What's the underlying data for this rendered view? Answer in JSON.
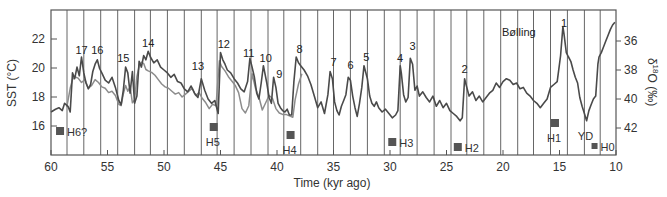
{
  "chart_data": {
    "type": "line",
    "title": "",
    "xlabel": "Time (kyr ago)",
    "ylabel": "SST (°C)",
    "ylabel_right": "δ18O (‰)",
    "ylabel_right_main": "δ",
    "ylabel_right_sup": "18",
    "ylabel_right_rest": "O (‰)",
    "xlim": [
      60,
      10
    ],
    "ylim": [
      14.0,
      23.8
    ],
    "ylim_right": [
      43.8,
      34.3
    ],
    "x_ticks": [
      60,
      55,
      50,
      45,
      40,
      35,
      30,
      25,
      20,
      15,
      10
    ],
    "y_ticks": [
      16,
      18,
      20,
      22
    ],
    "y_ticks_right": [
      36,
      38,
      40,
      42
    ],
    "grid": "vertical lines every ~1.47 kyr",
    "vertical_lines": [
      58.58,
      57.1,
      55.6,
      54.1,
      52.6,
      51.2,
      49.7,
      48.2,
      46.7,
      45.3,
      43.8,
      42.3,
      40.8,
      39.4,
      37.9,
      36.4,
      35.0,
      33.5,
      32.0,
      30.5,
      29.1,
      27.6,
      26.1,
      24.6,
      23.2,
      21.7,
      20.2,
      18.7,
      17.3,
      15.8,
      14.3,
      12.8,
      11.4
    ],
    "colors": {
      "d18O": "#4a4a4a",
      "sst": "#8c8c8c",
      "frame": "#555555",
      "grid": "#666666",
      "marker": "#555555"
    },
    "series": [
      {
        "name": "δ18O (‰)",
        "axis": "right",
        "x": [
          60.0,
          59.6,
          59.3,
          59.0,
          58.8,
          58.5,
          58.3,
          58.1,
          57.9,
          57.7,
          57.5,
          57.3,
          57.1,
          56.9,
          56.7,
          56.5,
          56.3,
          56.1,
          55.9,
          55.7,
          55.5,
          55.2,
          54.9,
          54.6,
          54.3,
          54.0,
          53.8,
          53.6,
          53.4,
          53.2,
          53.0,
          52.8,
          52.6,
          52.4,
          52.2,
          52.0,
          51.8,
          51.6,
          51.4,
          51.2,
          50.9,
          50.6,
          50.3,
          50.0,
          49.7,
          49.4,
          49.1,
          48.8,
          48.5,
          48.2,
          47.9,
          47.6,
          47.3,
          47.0,
          46.7,
          46.4,
          46.1,
          45.8,
          45.5,
          45.2,
          45.0,
          44.8,
          44.6,
          44.4,
          44.1,
          43.8,
          43.5,
          43.2,
          42.9,
          42.6,
          42.4,
          42.2,
          42.0,
          41.8,
          41.6,
          41.4,
          41.2,
          40.9,
          40.7,
          40.5,
          40.3,
          40.1,
          39.9,
          39.7,
          39.5,
          39.3,
          39.1,
          38.9,
          38.7,
          38.5,
          38.3,
          38.1,
          37.9,
          37.6,
          37.3,
          37.0,
          36.7,
          36.4,
          36.1,
          35.8,
          35.5,
          35.3,
          35.1,
          34.9,
          34.7,
          34.5,
          34.3,
          34.1,
          33.9,
          33.7,
          33.5,
          33.3,
          33.1,
          32.9,
          32.7,
          32.5,
          32.3,
          32.0,
          31.8,
          31.6,
          31.4,
          31.2,
          31.0,
          30.7,
          30.4,
          30.1,
          29.8,
          29.5,
          29.3,
          29.1,
          29.0,
          28.8,
          28.6,
          28.4,
          28.2,
          28.0,
          27.8,
          27.6,
          27.4,
          27.1,
          26.8,
          26.5,
          26.2,
          25.9,
          25.6,
          25.3,
          25.0,
          24.7,
          24.4,
          24.1,
          23.8,
          23.6,
          23.4,
          23.2,
          23.0,
          22.7,
          22.4,
          22.1,
          21.8,
          21.5,
          21.2,
          20.9,
          20.6,
          20.3,
          20.0,
          19.7,
          19.4,
          19.1,
          18.8,
          18.5,
          18.2,
          17.9,
          17.6,
          17.3,
          17.0,
          16.7,
          16.4,
          16.1,
          15.8,
          15.5,
          15.2,
          14.9,
          14.7,
          14.6,
          14.4,
          14.2,
          14.0,
          13.8,
          13.6,
          13.4,
          13.2,
          13.0,
          12.8,
          12.6,
          12.4,
          12.2,
          12.0,
          11.8,
          11.6,
          11.5,
          11.3,
          11.1,
          10.9,
          10.7,
          10.5,
          10.3,
          10.1
        ],
        "values": [
          40.9,
          40.7,
          40.6,
          40.8,
          40.3,
          40.5,
          40.9,
          38.2,
          38.6,
          37.8,
          38.4,
          37.1,
          38.2,
          38.9,
          39.3,
          39.0,
          38.1,
          37.6,
          37.3,
          37.9,
          38.2,
          38.7,
          38.9,
          38.5,
          39.2,
          40.1,
          40.4,
          39.4,
          37.8,
          38.2,
          39.6,
          38.1,
          40.3,
          39.8,
          37.4,
          37.8,
          37.0,
          37.3,
          36.7,
          37.1,
          37.5,
          37.3,
          37.8,
          38.0,
          38.2,
          38.5,
          38.3,
          38.8,
          38.9,
          39.3,
          39.5,
          39.1,
          39.6,
          39.9,
          38.6,
          39.4,
          40.0,
          40.3,
          40.1,
          41.0,
          36.8,
          37.3,
          37.6,
          38.0,
          38.2,
          38.6,
          38.9,
          39.3,
          39.5,
          38.8,
          37.2,
          37.8,
          38.5,
          39.6,
          40.0,
          38.9,
          37.7,
          38.9,
          39.9,
          40.3,
          38.5,
          39.2,
          40.3,
          40.6,
          40.8,
          40.9,
          40.7,
          41.1,
          41.1,
          38.8,
          37.1,
          37.5,
          37.7,
          38.0,
          38.4,
          39.0,
          39.8,
          40.6,
          40.2,
          41.0,
          39.7,
          38.1,
          38.6,
          40.2,
          40.8,
          41.1,
          40.5,
          40.1,
          39.7,
          38.5,
          38.7,
          39.8,
          40.6,
          41.2,
          40.3,
          39.2,
          37.7,
          38.6,
          39.8,
          40.3,
          40.5,
          40.2,
          40.6,
          40.9,
          40.7,
          41.0,
          41.3,
          41.1,
          40.8,
          37.7,
          38.2,
          39.7,
          40.2,
          39.9,
          37.2,
          37.6,
          39.4,
          39.1,
          39.8,
          39.5,
          39.9,
          40.2,
          39.8,
          40.5,
          40.1,
          40.6,
          40.3,
          40.8,
          41.0,
          41.2,
          41.5,
          41.3,
          38.6,
          39.2,
          39.8,
          39.5,
          40.1,
          39.8,
          40.2,
          39.9,
          39.6,
          39.4,
          38.9,
          39.2,
          38.8,
          38.6,
          38.7,
          39.0,
          38.9,
          39.3,
          39.2,
          39.6,
          39.8,
          40.1,
          40.3,
          40.6,
          40.3,
          40.0,
          39.2,
          39.0,
          38.8,
          37.0,
          35.0,
          35.5,
          36.8,
          37.1,
          37.4,
          38.0,
          38.5,
          38.9,
          39.9,
          40.5,
          41.0,
          41.5,
          40.8,
          40.4,
          40.0,
          39.8,
          37.6,
          37.1,
          36.8,
          36.4,
          36.0,
          35.6,
          35.2,
          34.9,
          34.7
        ]
      },
      {
        "name": "SST (°C)",
        "axis": "left",
        "x": [
          58.6,
          58.3,
          58.1,
          57.9,
          57.6,
          57.3,
          57.0,
          56.7,
          56.4,
          56.1,
          55.8,
          55.5,
          55.2,
          54.9,
          54.6,
          54.3,
          54.0,
          53.8,
          53.6,
          53.4,
          53.2,
          53.0,
          52.8,
          52.6,
          52.4,
          52.2,
          52.0,
          51.8,
          51.6,
          51.4,
          51.1,
          50.8,
          50.5,
          50.2,
          49.9,
          49.6,
          49.3,
          49.0,
          48.7,
          48.4,
          48.1,
          47.8,
          47.5,
          47.2,
          46.9,
          46.6,
          46.3,
          46.0,
          45.7,
          45.4,
          45.1,
          44.9,
          44.6,
          44.3,
          44.0,
          43.7,
          43.4,
          43.1,
          42.8,
          42.5,
          42.2,
          41.9,
          41.6,
          41.3,
          41.0,
          40.7,
          40.4,
          40.1,
          39.8,
          39.5,
          39.2,
          38.9,
          38.6,
          38.4,
          38.1,
          37.8
        ],
        "values": [
          17.3,
          18.6,
          19.2,
          19.4,
          19.3,
          19.0,
          19.2,
          18.6,
          18.8,
          19.2,
          19.0,
          18.7,
          18.6,
          18.3,
          18.4,
          18.1,
          17.5,
          17.4,
          18.2,
          18.8,
          18.4,
          18.7,
          17.6,
          17.8,
          19.4,
          20.1,
          20.4,
          20.3,
          19.9,
          19.8,
          19.7,
          19.5,
          19.2,
          18.9,
          18.7,
          18.6,
          18.4,
          18.2,
          18.3,
          18.0,
          18.2,
          18.4,
          18.6,
          18.1,
          18.3,
          17.9,
          17.6,
          17.2,
          17.5,
          17.4,
          20.5,
          20.1,
          19.8,
          19.4,
          19.1,
          18.8,
          18.3,
          17.2,
          16.9,
          17.4,
          19.6,
          18.6,
          18.0,
          17.1,
          17.6,
          18.1,
          17.9,
          17.2,
          16.9,
          16.8,
          16.8,
          16.7,
          16.6,
          17.8,
          18.9,
          19.6
        ]
      }
    ],
    "event_labels": [
      {
        "text": "17",
        "x": 57.3,
        "y_px": 54
      },
      {
        "text": "16",
        "x": 55.9,
        "y_px": 54
      },
      {
        "text": "15",
        "x": 53.6,
        "y_px": 62
      },
      {
        "text": "14",
        "x": 51.4,
        "y_px": 47
      },
      {
        "text": "13",
        "x": 47.0,
        "y_px": 70
      },
      {
        "text": "12",
        "x": 44.7,
        "y_px": 48
      },
      {
        "text": "11",
        "x": 42.5,
        "y_px": 57
      },
      {
        "text": "10",
        "x": 41.0,
        "y_px": 62
      },
      {
        "text": "9",
        "x": 39.8,
        "y_px": 78
      },
      {
        "text": "8",
        "x": 38.0,
        "y_px": 53
      },
      {
        "text": "7",
        "x": 35.0,
        "y_px": 66
      },
      {
        "text": "6",
        "x": 33.5,
        "y_px": 69
      },
      {
        "text": "5",
        "x": 32.1,
        "y_px": 61
      },
      {
        "text": "4",
        "x": 29.1,
        "y_px": 62
      },
      {
        "text": "3",
        "x": 28.0,
        "y_px": 50
      },
      {
        "text": "2",
        "x": 23.4,
        "y_px": 73
      },
      {
        "text": "1",
        "x": 14.6,
        "y_px": 27
      },
      {
        "text": "Bølling",
        "x": 18.6,
        "y_px": 36
      }
    ],
    "heinrich_events": [
      {
        "label": "H6?",
        "x": 59.2,
        "y_px": 131,
        "size": 8,
        "label_dx": 8,
        "label_dy": 5,
        "label_pos": "right"
      },
      {
        "label": "H5",
        "x": 45.6,
        "y_px": 127,
        "size": 8,
        "label_dx": -4,
        "label_dy": 19,
        "label_pos": "below"
      },
      {
        "label": "H4",
        "x": 38.8,
        "y_px": 135,
        "size": 8,
        "label_dx": -4,
        "label_dy": 19,
        "label_pos": "below"
      },
      {
        "label": "H3",
        "x": 29.8,
        "y_px": 142,
        "size": 8,
        "label_dx": 8,
        "label_dy": 5,
        "label_pos": "right"
      },
      {
        "label": "H2",
        "x": 24.0,
        "y_px": 147,
        "size": 8,
        "label_dx": 8,
        "label_dy": 5,
        "label_pos": "right"
      },
      {
        "label": "H1",
        "x": 15.4,
        "y_px": 123,
        "size": 8,
        "label_dx": -4,
        "label_dy": 19,
        "label_pos": "below"
      },
      {
        "label": "H0",
        "x": 11.9,
        "y_px": 146,
        "size": 6,
        "label_dx": 6,
        "label_dy": 5,
        "label_pos": "right"
      }
    ],
    "annotations": [
      {
        "text": "YD",
        "x": 12.7,
        "y_px": 140
      }
    ]
  }
}
